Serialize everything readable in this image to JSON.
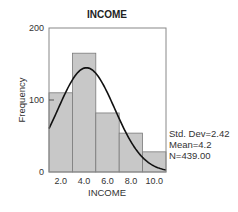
{
  "chart_data": {
    "type": "bar",
    "title": "INCOME",
    "xlabel": "INCOME",
    "ylabel": "Frequency",
    "categories": [
      "2.0",
      "4.0",
      "6.0",
      "8.0",
      "10.0"
    ],
    "bin_centers": [
      2,
      4,
      6,
      8,
      10
    ],
    "bin_width": 2,
    "values": [
      110,
      165,
      82,
      54,
      28
    ],
    "xlim": [
      1,
      11
    ],
    "ylim": [
      0,
      200
    ],
    "y_ticks": [
      0,
      100,
      200
    ],
    "x_ticks": [
      "2.0",
      "4.0",
      "6.0",
      "8.0",
      "10.0"
    ],
    "grid": false,
    "overlay": {
      "type": "normal_curve",
      "mean": 4.2,
      "std_dev": 2.42,
      "n": 439
    },
    "stats": {
      "std_dev": "Std. Dev=2.42",
      "mean": "Mean=4.2",
      "n": "N=439.00"
    },
    "colors": {
      "bar_fill": "#c8c8c8",
      "bar_edge": "#7a7a7a",
      "curve": "#111111",
      "frame": "#888888"
    }
  }
}
